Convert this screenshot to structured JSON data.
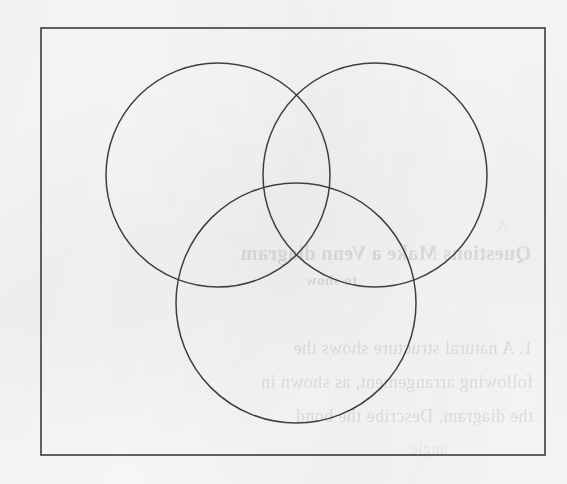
{
  "document": {
    "kind": "scanned-worksheet-page",
    "page_background_color": "#fbfbfa",
    "ink_color": "#3f3f42",
    "border_color": "#3b3b3d"
  },
  "diagram": {
    "type": "venn",
    "set_count": 3,
    "labels_present": "none",
    "border": {
      "name": "universal-set-rectangle",
      "x": 41,
      "y": 28,
      "width": 504,
      "height": 427
    },
    "circles": [
      {
        "name": "top-left-circle",
        "cx": 218,
        "cy": 175,
        "r": 112
      },
      {
        "name": "top-right-circle",
        "cx": 375,
        "cy": 175,
        "r": 112
      },
      {
        "name": "bottom-circle",
        "cx": 296,
        "cy": 303,
        "r": 120
      }
    ]
  },
  "bleed_through": {
    "description": "faint mirrored text showing through from the reverse side of the sheet",
    "lines": [
      {
        "text": "Questions  Make a Venn diagram",
        "x": 36,
        "y": 255,
        "style": "bleed-heading"
      },
      {
        "text": "to show",
        "x": 210,
        "y": 283,
        "style": "bleed-sub"
      },
      {
        "text": "1.  A natural structure shows the",
        "x": 34,
        "y": 352,
        "style": "bleed-body"
      },
      {
        "text": "following arrangement, as shown in",
        "x": 34,
        "y": 386,
        "style": "bleed-body"
      },
      {
        "text": "the diagram. Describe the bond",
        "x": 34,
        "y": 420,
        "style": "bleed-body"
      },
      {
        "text": "angle",
        "x": 120,
        "y": 452,
        "style": "bleed-faint"
      },
      {
        "text": "A",
        "x": 58,
        "y": 228,
        "style": "bleed-faint"
      }
    ]
  }
}
